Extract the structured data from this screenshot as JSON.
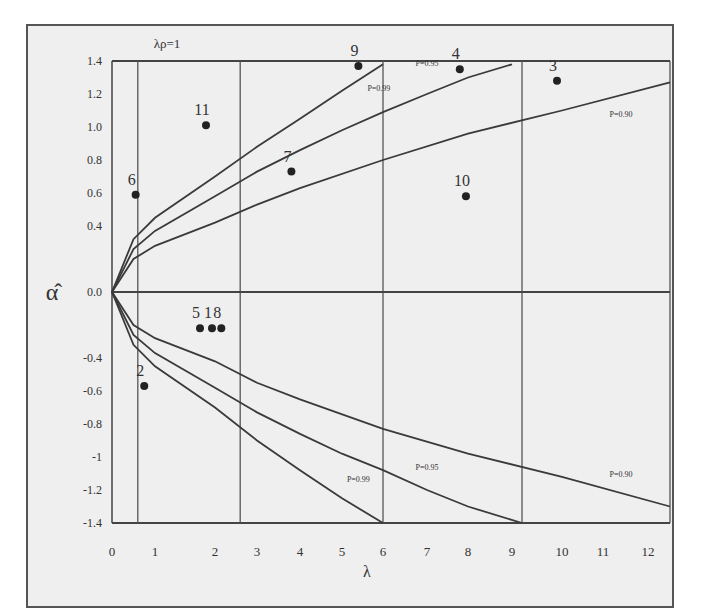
{
  "chart_data": {
    "type": "scatter",
    "title": "",
    "header_annotation": "λρ=1",
    "xlabel": "λ",
    "ylabel": "α̂",
    "xlim": [
      0,
      12.5
    ],
    "ylim": [
      -1.4,
      1.4
    ],
    "x_ticks": [
      "0",
      "1",
      "2",
      "3",
      "4",
      "5",
      "6",
      "7",
      "8",
      "9",
      "10",
      "11",
      "12"
    ],
    "y_ticks": [
      "1.4",
      "1.2",
      "1.0",
      "0.8",
      "0.6",
      "0.4",
      "0.0",
      "-0.4",
      "-0.6",
      "-0.8",
      "-1",
      "-1.2",
      "-1.4"
    ],
    "grid": false,
    "vertical_reference_lines_x": [
      0.6,
      2.6,
      6.0,
      9.2,
      12.5
    ],
    "horizontal_reference_line_y": 0.0,
    "points": [
      {
        "label": "1",
        "x": 1.95,
        "y": -0.22
      },
      {
        "label": "2",
        "x": 0.75,
        "y": -0.57
      },
      {
        "label": "3",
        "x": 9.9,
        "y": 1.28
      },
      {
        "label": "4",
        "x": 7.8,
        "y": 1.35
      },
      {
        "label": "5",
        "x": 1.75,
        "y": -0.22
      },
      {
        "label": "6",
        "x": 0.55,
        "y": 0.59
      },
      {
        "label": "7",
        "x": 3.8,
        "y": 0.73
      },
      {
        "label": "8",
        "x": 2.15,
        "y": -0.22
      },
      {
        "label": "9",
        "x": 5.4,
        "y": 1.37
      },
      {
        "label": "10",
        "x": 7.95,
        "y": 0.58
      },
      {
        "label": "11",
        "x": 1.85,
        "y": 1.01
      }
    ],
    "series": [
      {
        "name": "P=0.99 (upper)",
        "x": [
          0,
          0.5,
          1,
          2,
          3,
          4,
          5,
          6
        ],
        "values": [
          0,
          0.32,
          0.45,
          0.7,
          0.88,
          1.05,
          1.22,
          1.38
        ]
      },
      {
        "name": "P=0.95 (upper)",
        "x": [
          0,
          0.5,
          1,
          2,
          3,
          4,
          5,
          6,
          7,
          8,
          9
        ],
        "values": [
          0,
          0.26,
          0.37,
          0.58,
          0.73,
          0.86,
          0.98,
          1.09,
          1.2,
          1.3,
          1.38
        ]
      },
      {
        "name": "P=0.90 (upper)",
        "x": [
          0,
          0.5,
          1,
          2,
          3,
          4,
          6,
          8,
          10,
          12.5
        ],
        "values": [
          0,
          0.2,
          0.28,
          0.42,
          0.53,
          0.63,
          0.8,
          0.96,
          1.1,
          1.27
        ]
      },
      {
        "name": "P=0.99 (lower)",
        "x": [
          0,
          0.5,
          1,
          2,
          3,
          4,
          5,
          6
        ],
        "values": [
          0,
          -0.32,
          -0.45,
          -0.7,
          -0.9,
          -1.08,
          -1.25,
          -1.4
        ]
      },
      {
        "name": "P=0.95 (lower)",
        "x": [
          0,
          0.5,
          1,
          2,
          3,
          4,
          5,
          6,
          7,
          8,
          9.2
        ],
        "values": [
          0,
          -0.26,
          -0.37,
          -0.58,
          -0.73,
          -0.86,
          -0.98,
          -1.08,
          -1.2,
          -1.3,
          -1.4
        ]
      },
      {
        "name": "P=0.90 (lower)",
        "x": [
          0,
          0.5,
          1,
          2,
          3,
          4,
          6,
          8,
          10,
          12.5
        ],
        "values": [
          0,
          -0.2,
          -0.28,
          -0.42,
          -0.55,
          -0.65,
          -0.83,
          -0.98,
          -1.12,
          -1.3
        ]
      }
    ],
    "curve_labels": [
      {
        "text": "P=0.99",
        "x": 5.9,
        "y": 1.22
      },
      {
        "text": "P=0.95",
        "x": 7.0,
        "y": 1.37
      },
      {
        "text": "P=0.90",
        "x": 11.4,
        "y": 1.06
      },
      {
        "text": "P=0.99",
        "x": 5.4,
        "y": -1.15
      },
      {
        "text": "P=0.95",
        "x": 7.0,
        "y": -1.08
      },
      {
        "text": "P=0.90",
        "x": 11.4,
        "y": -1.12
      }
    ]
  }
}
